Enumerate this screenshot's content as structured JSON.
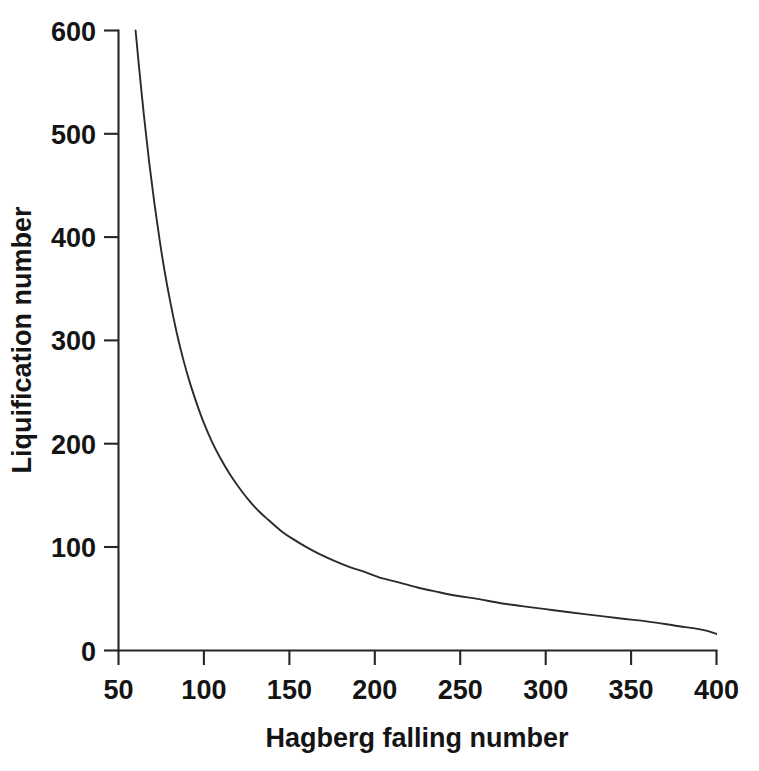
{
  "chart_data": {
    "type": "line",
    "title": "",
    "xlabel": "Hagberg falling number",
    "ylabel": "Liquification number",
    "xlim": [
      50,
      400
    ],
    "ylim": [
      0,
      600
    ],
    "xticks": [
      50,
      100,
      150,
      200,
      250,
      300,
      350,
      400
    ],
    "xticklabels": [
      "50",
      "100",
      "150",
      "200",
      "250",
      "300",
      "350",
      "400"
    ],
    "yticks": [
      0,
      100,
      200,
      300,
      400,
      500,
      600
    ],
    "yticklabels": [
      "0",
      "100",
      "200",
      "300",
      "400",
      "500",
      "600"
    ],
    "grid": false,
    "legend": null,
    "series": [
      {
        "name": "Liquification number vs Hagberg falling number",
        "color": "#2b2b2b",
        "x": [
          60,
          62,
          65,
          68,
          71,
          74,
          77,
          80,
          84,
          88,
          92,
          96,
          100,
          105,
          110,
          115,
          120,
          126,
          132,
          138,
          145,
          152,
          160,
          168,
          176,
          185,
          194,
          204,
          214,
          225,
          236,
          248,
          260,
          273,
          286,
          300,
          314,
          329,
          344,
          360,
          376,
          392,
          400
        ],
        "y": [
          600,
          565,
          516,
          472,
          433,
          398,
          367,
          340,
          308,
          281,
          258,
          238,
          220,
          201,
          185,
          171,
          159,
          146,
          135,
          126,
          116,
          108,
          100,
          93,
          87,
          81,
          76,
          70,
          66,
          61,
          57,
          53,
          50,
          46,
          43,
          40,
          37,
          34,
          31,
          28,
          24,
          20,
          16
        ]
      }
    ],
    "annotations": []
  },
  "figure": {
    "background": "#ffffff",
    "axis_color": "#262626",
    "text_color": "#141414"
  }
}
